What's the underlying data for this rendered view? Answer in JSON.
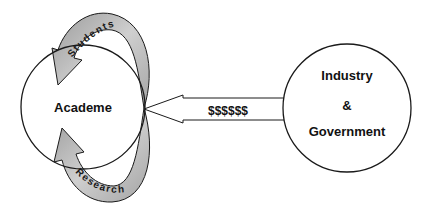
{
  "diagram": {
    "nodes": {
      "academe": {
        "label": "Academe"
      },
      "industry_government": {
        "lines": [
          "Industry",
          "&",
          "Government"
        ]
      }
    },
    "edges": {
      "funding": {
        "label": "$$$$$$",
        "from": "Industry & Government",
        "to": "Academe"
      },
      "students": {
        "label": "Students",
        "from": "Academe",
        "to": "Academe"
      },
      "research": {
        "label": "Research",
        "from": "Academe",
        "to": "Academe"
      }
    },
    "colors": {
      "stroke": "#1a1a1a",
      "arrow_fill": "#b8b8b8",
      "background": "#ffffff"
    }
  }
}
